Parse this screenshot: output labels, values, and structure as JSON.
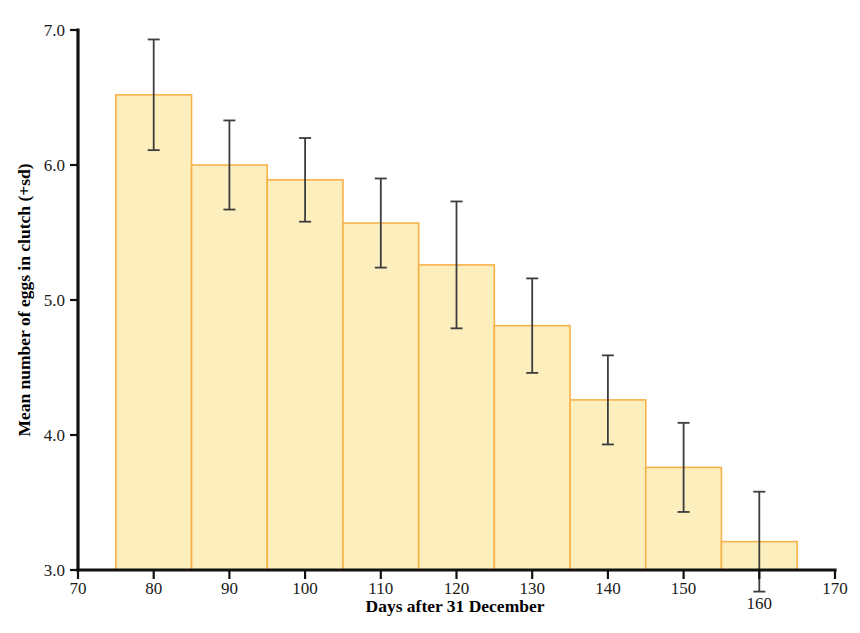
{
  "chart_data": {
    "type": "bar",
    "title": "",
    "xlabel": "Days after 31 December",
    "ylabel": "Mean number of eggs in clutch (+sd)",
    "categories": [
      80,
      90,
      100,
      110,
      120,
      130,
      140,
      150,
      160
    ],
    "bar_left_edges": [
      75,
      85,
      95,
      105,
      115,
      125,
      135,
      145,
      155
    ],
    "bar_right_edges": [
      85,
      95,
      105,
      115,
      125,
      135,
      145,
      155,
      165
    ],
    "values": [
      6.52,
      6.0,
      5.89,
      5.57,
      5.26,
      4.81,
      4.26,
      3.76,
      3.21
    ],
    "errors": [
      0.41,
      0.33,
      0.31,
      0.33,
      0.47,
      0.35,
      0.33,
      0.33,
      0.37
    ],
    "xlim": [
      70,
      170
    ],
    "ylim": [
      3.0,
      7.0
    ],
    "xticks": [
      70,
      80,
      90,
      100,
      110,
      120,
      130,
      140,
      150,
      160,
      170
    ],
    "xtick_labels": [
      "70",
      "80",
      "90",
      "100",
      "110",
      "120",
      "130",
      "140",
      "150",
      "160",
      "170"
    ],
    "yticks": [
      3.0,
      4.0,
      5.0,
      6.0,
      7.0
    ],
    "ytick_labels": [
      "3.0",
      "4.0",
      "5.0",
      "6.0",
      "7.0"
    ],
    "grid": false,
    "legend": "none",
    "bar_fill_color": "#fdeebe",
    "bar_edge_color": "#f7b24a",
    "error_bar_color": "#3d3d3d",
    "axis_color": "#111111",
    "dropped_xtick_labels": [
      "160"
    ],
    "error_bar_style": "symmetric-caps"
  }
}
